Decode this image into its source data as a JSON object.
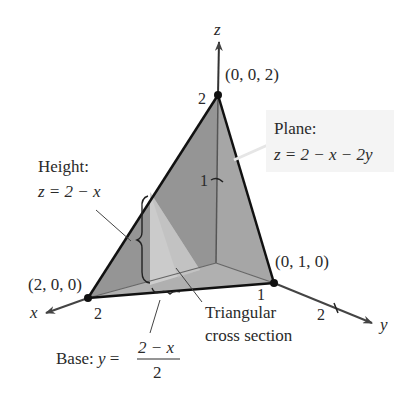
{
  "figure": {
    "axes": {
      "x": {
        "label": "x",
        "tick": "2"
      },
      "y": {
        "label": "y",
        "ticks": [
          "1",
          "2"
        ]
      },
      "z": {
        "label": "z",
        "ticks": [
          "1",
          "2"
        ]
      }
    },
    "points": {
      "apex": "(0, 0, 2)",
      "x_intercept": "(2, 0, 0)",
      "y_intercept": "(0, 1, 0)"
    },
    "annotations": {
      "plane_title": "Plane:",
      "plane_eq": "z = 2 − x − 2y",
      "height_title": "Height:",
      "height_eq": "z = 2 − x",
      "cross_section_line1": "Triangular",
      "cross_section_line2": "cross section",
      "base_prefix": "Base: ",
      "base_var": "y",
      "base_equals": " = ",
      "base_numerator": "2 − x",
      "base_denominator": "2"
    },
    "colors": {
      "plane_face": "#9a9a9a",
      "side_face_xz": "#8c8c8c",
      "right_face_yz": "#b0b0b0",
      "floor_face": "#c8c8c8",
      "cross_section": "#cfcfcf",
      "edge": "#111111"
    }
  }
}
